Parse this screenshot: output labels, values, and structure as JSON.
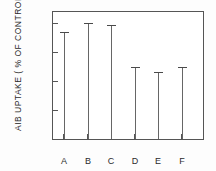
{
  "chart_data": {
    "type": "bar",
    "title": "",
    "subtitle": "",
    "xlabel": "",
    "ylabel": "AIB  UPTAKE ( % OF CONTROL )",
    "categories": [
      "A",
      "B",
      "C",
      "D",
      "E",
      "F"
    ],
    "values": [
      148,
      160,
      157,
      99,
      93,
      99
    ],
    "ylim": [
      0,
      175
    ],
    "yticks": [
      40,
      80,
      120,
      160
    ],
    "ytick_labels": [
      "40",
      "80",
      "120",
      "160"
    ],
    "grid": false,
    "legend": "none"
  },
  "axis": {
    "y_title": "AIB  UPTAKE ( % OF CONTROL )",
    "tick_160": "160",
    "tick_120": "120",
    "tick_80": "80",
    "tick_40": "40"
  },
  "categories": {
    "a": "A",
    "b": "B",
    "c": "C",
    "d": "D",
    "e": "E",
    "f": "F"
  },
  "colors": {
    "frame": "#555555",
    "bar": "#666666",
    "cap": "#4a4a4a",
    "text": "#2b2b2b",
    "background": "#ffffff"
  }
}
